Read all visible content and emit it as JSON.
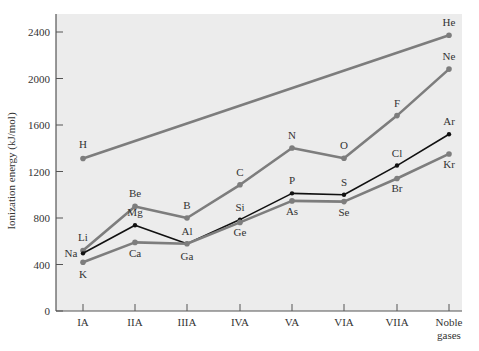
{
  "chart_data": {
    "type": "line",
    "title": "",
    "xlabel": "",
    "ylabel": "Ionization energy (kJ/mol)",
    "ylim": [
      0,
      2400
    ],
    "yticks": [
      0,
      400,
      800,
      1200,
      1600,
      2000,
      2400
    ],
    "categories": [
      "IA",
      "IIA",
      "IIIA",
      "IVA",
      "VA",
      "VIA",
      "VIIA",
      "Noble gases"
    ],
    "grid": false,
    "legend": null,
    "colors": {
      "plot_bg": "#ececec",
      "gray_series": "#7d7d7d",
      "black_series": "#111111",
      "axis": "#555555"
    },
    "series": [
      {
        "name": "Period 1",
        "color": "gray",
        "points": [
          {
            "cat": 0,
            "label": "H",
            "value": 1312
          },
          {
            "cat": 7,
            "label": "He",
            "value": 2372
          }
        ]
      },
      {
        "name": "Period 2",
        "color": "gray",
        "points": [
          {
            "cat": 0,
            "label": "Li",
            "value": 520
          },
          {
            "cat": 1,
            "label": "Be",
            "value": 900
          },
          {
            "cat": 2,
            "label": "B",
            "value": 800
          },
          {
            "cat": 3,
            "label": "C",
            "value": 1086
          },
          {
            "cat": 4,
            "label": "N",
            "value": 1402
          },
          {
            "cat": 5,
            "label": "O",
            "value": 1314
          },
          {
            "cat": 6,
            "label": "F",
            "value": 1681
          },
          {
            "cat": 7,
            "label": "Ne",
            "value": 2081
          }
        ]
      },
      {
        "name": "Period 3",
        "color": "black",
        "points": [
          {
            "cat": 0,
            "label": "Na",
            "value": 496
          },
          {
            "cat": 1,
            "label": "Mg",
            "value": 738
          },
          {
            "cat": 2,
            "label": "Al",
            "value": 578
          },
          {
            "cat": 3,
            "label": "Si",
            "value": 786
          },
          {
            "cat": 4,
            "label": "P",
            "value": 1012
          },
          {
            "cat": 5,
            "label": "S",
            "value": 1000
          },
          {
            "cat": 6,
            "label": "Cl",
            "value": 1251
          },
          {
            "cat": 7,
            "label": "Ar",
            "value": 1521
          }
        ]
      },
      {
        "name": "Period 4",
        "color": "gray",
        "points": [
          {
            "cat": 0,
            "label": "K",
            "value": 419
          },
          {
            "cat": 1,
            "label": "Ca",
            "value": 590
          },
          {
            "cat": 2,
            "label": "Ga",
            "value": 579
          },
          {
            "cat": 3,
            "label": "Ge",
            "value": 762
          },
          {
            "cat": 4,
            "label": "As",
            "value": 947
          },
          {
            "cat": 5,
            "label": "Se",
            "value": 941
          },
          {
            "cat": 6,
            "label": "Br",
            "value": 1140
          },
          {
            "cat": 7,
            "label": "Kr",
            "value": 1351
          }
        ]
      }
    ]
  }
}
